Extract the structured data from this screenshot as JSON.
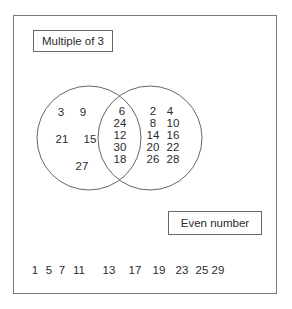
{
  "diagram": {
    "type": "venn",
    "universe": {
      "elements_outside": [
        "1",
        "5",
        "7",
        "11",
        "13",
        "17",
        "19",
        "23",
        "25",
        "29"
      ]
    },
    "set_a": {
      "label": "Multiple of 3",
      "only": [
        "3",
        "9",
        "21",
        "15",
        "27"
      ]
    },
    "set_b": {
      "label": "Even number",
      "only": [
        "2",
        "4",
        "8",
        "10",
        "14",
        "16",
        "20",
        "22",
        "26",
        "28"
      ]
    },
    "intersection": [
      "6",
      "24",
      "12",
      "30",
      "18"
    ]
  },
  "colors": {
    "line": "#666666",
    "text": "#2b2b2b",
    "background": "#ffffff"
  }
}
